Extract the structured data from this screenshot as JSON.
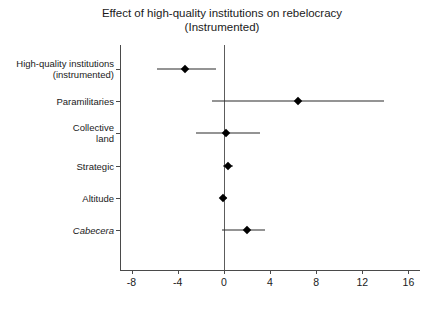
{
  "chart_data": {
    "type": "scatter",
    "subtype": "coefficient-plot",
    "title": "Effect of high-quality institutions on rebelocracy\n(Instrumented)",
    "title_line1": "Effect of high-quality institutions on rebelocracy",
    "title_line2": "(Instrumented)",
    "xlabel": "",
    "ylabel": "",
    "xlim": [
      -9.0,
      17.0
    ],
    "xticks": [
      -8,
      -4,
      0,
      4,
      8,
      12,
      16
    ],
    "xtick_labels": [
      "-8",
      "-4",
      "0",
      "4",
      "8",
      "12",
      "16"
    ],
    "grid": false,
    "legend": false,
    "zero_reference_line": 0,
    "categories": [
      "High-quality institutions\n(instrumented)",
      "Paramilitaries",
      "Collective\nland",
      "Strategic",
      "Altitude",
      "Cabecera"
    ],
    "points": [
      {
        "label": "High-quality institutions\n(instrumented)",
        "label_italic": false,
        "estimate": -3.4,
        "ci_low": -5.8,
        "ci_high": -0.65
      },
      {
        "label": "Paramilitaries",
        "label_italic": false,
        "estimate": 6.4,
        "ci_low": -1.0,
        "ci_high": 13.9
      },
      {
        "label": "Collective\nland",
        "label_italic": false,
        "estimate": 0.15,
        "ci_low": -2.4,
        "ci_high": 3.1
      },
      {
        "label": "Strategic",
        "label_italic": false,
        "estimate": 0.35,
        "ci_low": -0.1,
        "ci_high": 0.8
      },
      {
        "label": "Altitude",
        "label_italic": false,
        "estimate": -0.05,
        "ci_low": -0.35,
        "ci_high": 0.3
      },
      {
        "label": "Cabecera",
        "label_italic": true,
        "estimate": 2.0,
        "ci_low": -0.15,
        "ci_high": 3.6
      }
    ],
    "colors": {
      "marker": "#000000",
      "ci": "#2a2a2a",
      "axis": "#4a4a4a",
      "zero_line": "#5c5c5c",
      "text": "#1a1a1a",
      "background": "#ffffff"
    }
  }
}
